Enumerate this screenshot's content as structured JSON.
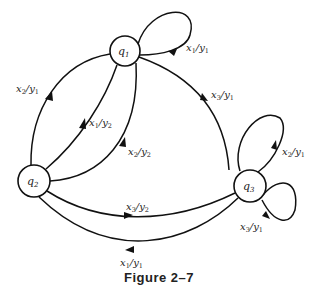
{
  "figure": {
    "caption": "Figure 2–7"
  },
  "states": [
    {
      "id": "q1",
      "base": "q",
      "sub": "1",
      "cx": 125,
      "cy": 51,
      "r": 15
    },
    {
      "id": "q2",
      "base": "q",
      "sub": "2",
      "cx": 34,
      "cy": 181,
      "r": 16
    },
    {
      "id": "q3",
      "base": "q",
      "sub": "3",
      "cx": 250,
      "cy": 186,
      "r": 16
    }
  ],
  "edges": [
    {
      "from": "q1",
      "to": "q1",
      "input": "x1",
      "output": "y1",
      "label": {
        "x_base": "x",
        "x_sub": "1",
        "y_base": "y",
        "y_sub": "1"
      }
    },
    {
      "from": "q1",
      "to": "q2",
      "input": "x2",
      "output": "y1",
      "label": {
        "x_base": "x",
        "x_sub": "2",
        "y_base": "y",
        "y_sub": "1"
      }
    },
    {
      "from": "q2",
      "to": "q1",
      "input": "x1",
      "output": "y2",
      "label": {
        "x_base": "x",
        "x_sub": "1",
        "y_base": "y",
        "y_sub": "2"
      }
    },
    {
      "from": "q2",
      "to": "q1",
      "input": "x2",
      "output": "y2",
      "label": {
        "x_base": "x",
        "x_sub": "2",
        "y_base": "y",
        "y_sub": "2"
      }
    },
    {
      "from": "q1",
      "to": "q3",
      "input": "x3",
      "output": "y1",
      "label": {
        "x_base": "x",
        "x_sub": "3",
        "y_base": "y",
        "y_sub": "1"
      }
    },
    {
      "from": "q3",
      "to": "q3",
      "input": "x2",
      "output": "y1",
      "label": {
        "x_base": "x",
        "x_sub": "2",
        "y_base": "y",
        "y_sub": "1"
      }
    },
    {
      "from": "q3",
      "to": "q3",
      "input": "x3",
      "output": "y1",
      "label": {
        "x_base": "x",
        "x_sub": "3",
        "y_base": "y",
        "y_sub": "1"
      }
    },
    {
      "from": "q2",
      "to": "q3",
      "input": "x3",
      "output": "y2",
      "label": {
        "x_base": "x",
        "x_sub": "3",
        "y_base": "y",
        "y_sub": "2"
      }
    },
    {
      "from": "q3",
      "to": "q2",
      "input": "x1",
      "output": "y1",
      "label": {
        "x_base": "x",
        "x_sub": "1",
        "y_base": "y",
        "y_sub": "1"
      }
    }
  ],
  "slash": "/"
}
